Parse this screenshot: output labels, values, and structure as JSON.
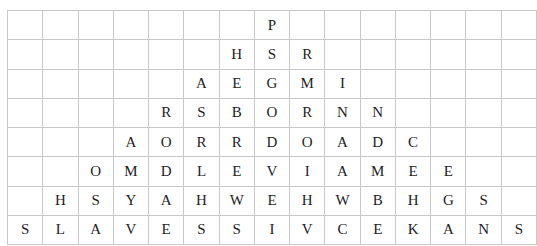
{
  "document": {
    "kind": "letter-grid",
    "description": "Triangular arrangement of capital letters in a bordered grid",
    "rows": 8,
    "columns": 15,
    "colors": {
      "background": "#ffffff",
      "grid_line": "#c8c8cc",
      "outer_border": "#b9b9bd",
      "letter": "#1d1d1f"
    }
  },
  "grid": {
    "cells": [
      [
        "",
        "",
        "",
        "",
        "",
        "",
        "",
        "P",
        "",
        "",
        "",
        "",
        "",
        "",
        ""
      ],
      [
        "",
        "",
        "",
        "",
        "",
        "",
        "H",
        "S",
        "R",
        "",
        "",
        "",
        "",
        "",
        ""
      ],
      [
        "",
        "",
        "",
        "",
        "",
        "A",
        "E",
        "G",
        "M",
        "I",
        "",
        "",
        "",
        "",
        ""
      ],
      [
        "",
        "",
        "",
        "",
        "R",
        "S",
        "B",
        "O",
        "R",
        "N",
        "N",
        "",
        "",
        "",
        ""
      ],
      [
        "",
        "",
        "",
        "A",
        "O",
        "R",
        "R",
        "D",
        "O",
        "A",
        "D",
        "C",
        "",
        "",
        ""
      ],
      [
        "",
        "",
        "O",
        "M",
        "D",
        "L",
        "E",
        "V",
        "I",
        "A",
        "M",
        "E",
        "E",
        "",
        ""
      ],
      [
        "",
        "H",
        "S",
        "Y",
        "A",
        "H",
        "W",
        "E",
        "H",
        "W",
        "B",
        "H",
        "G",
        "S",
        ""
      ],
      [
        "S",
        "L",
        "A",
        "V",
        "E",
        "S",
        "S",
        "I",
        "V",
        "C",
        "E",
        "K",
        "A",
        "N",
        "S"
      ]
    ]
  }
}
